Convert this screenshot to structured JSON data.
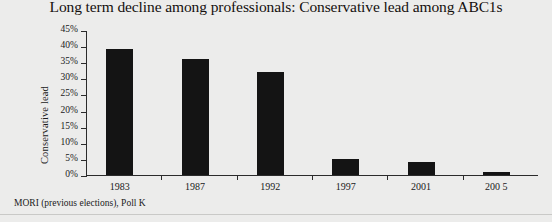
{
  "chart_data": {
    "type": "bar",
    "title": "Long term decline among professionals: Conservative lead among ABC1s",
    "xlabel": "",
    "ylabel": "Conservative lead",
    "categories": [
      "1983",
      "1987",
      "1992",
      "1997",
      "2001",
      "200 5"
    ],
    "values": [
      39,
      36,
      32,
      5,
      4,
      1
    ],
    "series": [
      {
        "name": "Conservative lead",
        "values": [
          39,
          36,
          32,
          5,
          4,
          1
        ]
      }
    ],
    "ylim": [
      0,
      45
    ],
    "ytick_step": 5,
    "ytick_labels": [
      "0%",
      "5%",
      "10%",
      "15%",
      "20%",
      "25%",
      "30%",
      "35%",
      "40%",
      "45%"
    ],
    "ytick_values": [
      0,
      5,
      10,
      15,
      20,
      25,
      30,
      35,
      40,
      45
    ],
    "grid": false,
    "legend": "none",
    "bar_color": "#141414",
    "axis_color": "#2b2b2b",
    "background_color": "#ececeb"
  },
  "footer": {
    "source": "MORI (previous elections), Poll K"
  }
}
